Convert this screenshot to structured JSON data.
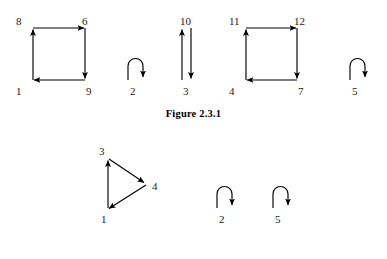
{
  "document": {
    "background_color": "#ffffff",
    "ink_color": "#000000"
  },
  "figures": [
    {
      "id": "figure-2-3-1",
      "caption": "Figure 2.3.1",
      "components": [
        {
          "id": "square-left",
          "kind": "directed-cycle",
          "nodes": [
            "8",
            "6",
            "9",
            "1"
          ],
          "edges": [
            "1 -> 8",
            "8 -> 6",
            "6 -> 9",
            "9 -> 1"
          ]
        },
        {
          "id": "loop-2",
          "kind": "self-loop",
          "nodes": [
            "2"
          ],
          "edges": [
            "2 -> 2"
          ]
        },
        {
          "id": "pair-3-10",
          "kind": "double-edge",
          "nodes": [
            "10",
            "3"
          ],
          "edges": [
            "3 -> 10",
            "10 -> 3"
          ]
        },
        {
          "id": "square-right",
          "kind": "directed-cycle",
          "nodes": [
            "11",
            "12",
            "7",
            "4"
          ],
          "edges": [
            "4 -> 11",
            "11 -> 12",
            "12 -> 7",
            "7 -> 4"
          ]
        },
        {
          "id": "loop-5",
          "kind": "self-loop",
          "nodes": [
            "5"
          ],
          "edges": [
            "5 -> 5"
          ]
        }
      ],
      "labels": {
        "n8": "8",
        "n6": "6",
        "n1": "1",
        "n9": "9",
        "n2": "2",
        "n10": "10",
        "n3": "3",
        "n11": "11",
        "n12": "12",
        "n4": "4",
        "n7": "7",
        "n5": "5"
      }
    },
    {
      "id": "figure-2-3-2",
      "caption": "Figure 2.3.2",
      "components": [
        {
          "id": "triangle",
          "kind": "directed-cycle",
          "nodes": [
            "3",
            "4",
            "1"
          ],
          "edges": [
            "1 -> 3",
            "3 -> 4",
            "4 -> 1"
          ]
        },
        {
          "id": "loop-2",
          "kind": "self-loop",
          "nodes": [
            "2"
          ],
          "edges": [
            "2 -> 2"
          ]
        },
        {
          "id": "loop-5",
          "kind": "self-loop",
          "nodes": [
            "5"
          ],
          "edges": [
            "5 -> 5"
          ]
        }
      ],
      "labels": {
        "n3": "3",
        "n4": "4",
        "n1": "1",
        "n2": "2",
        "n5": "5"
      }
    }
  ]
}
